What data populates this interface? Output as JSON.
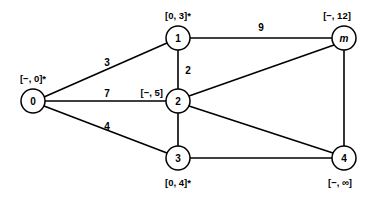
{
  "diagram": {
    "type": "weighted-undirected-graph",
    "title": "",
    "canvas": {
      "width": 369,
      "height": 199,
      "background": "#ffffff"
    },
    "stroke_color": "#000000",
    "node_fill": "#ffffff"
  },
  "nodes": [
    {
      "id": "0",
      "text": "0",
      "italic": false,
      "x": 33,
      "y": 101,
      "r": 12,
      "label": "[−, 0]*",
      "label_x": 33,
      "label_y": 78,
      "label_anchor": "middle"
    },
    {
      "id": "1",
      "text": "1",
      "italic": false,
      "x": 178,
      "y": 38,
      "r": 12,
      "label": "[0, 3]*",
      "label_x": 178,
      "label_y": 15,
      "label_anchor": "middle"
    },
    {
      "id": "2",
      "text": "2",
      "italic": false,
      "x": 178,
      "y": 101,
      "r": 12,
      "label": "[−, 5]",
      "label_x": 163,
      "label_y": 92,
      "label_anchor": "end"
    },
    {
      "id": "3",
      "text": "3",
      "italic": false,
      "x": 178,
      "y": 158,
      "r": 12,
      "label": "[0, 4]*",
      "label_x": 178,
      "label_y": 182,
      "label_anchor": "middle"
    },
    {
      "id": "m",
      "text": "m",
      "italic": true,
      "x": 344,
      "y": 38,
      "r": 12,
      "label": "[−, 12]",
      "label_x": 337,
      "label_y": 15,
      "label_anchor": "middle"
    },
    {
      "id": "4",
      "text": "4",
      "italic": false,
      "x": 344,
      "y": 158,
      "r": 12,
      "label": "[−, ∞]",
      "label_x": 340,
      "label_y": 182,
      "label_anchor": "middle"
    }
  ],
  "edges": [
    {
      "from": "0",
      "to": "1",
      "weight": "3",
      "weight_x": 107,
      "weight_y": 62,
      "x1": 44,
      "y1": 97,
      "x2": 167,
      "y2": 43
    },
    {
      "from": "0",
      "to": "2",
      "weight": "7",
      "weight_x": 107,
      "weight_y": 93,
      "x1": 45,
      "y1": 101,
      "x2": 166,
      "y2": 101
    },
    {
      "from": "0",
      "to": "3",
      "weight": "4",
      "weight_x": 107,
      "weight_y": 126,
      "x1": 44,
      "y1": 106,
      "x2": 167,
      "y2": 153
    },
    {
      "from": "1",
      "to": "2",
      "weight": "2",
      "weight_x": 188,
      "weight_y": 70,
      "x1": 178,
      "y1": 50,
      "x2": 178,
      "y2": 89
    },
    {
      "from": "1",
      "to": "m",
      "weight": "9",
      "weight_x": 261,
      "weight_y": 27,
      "x1": 190,
      "y1": 38,
      "x2": 332,
      "y2": 38
    },
    {
      "from": "2",
      "to": "m",
      "weight": "",
      "weight_x": 0,
      "weight_y": 0,
      "x1": 189,
      "y1": 96,
      "x2": 334,
      "y2": 45
    },
    {
      "from": "2",
      "to": "3",
      "weight": "",
      "weight_x": 0,
      "weight_y": 0,
      "x1": 178,
      "y1": 113,
      "x2": 178,
      "y2": 146
    },
    {
      "from": "2",
      "to": "4",
      "weight": "",
      "weight_x": 0,
      "weight_y": 0,
      "x1": 189,
      "y1": 106,
      "x2": 333,
      "y2": 153
    },
    {
      "from": "3",
      "to": "4",
      "weight": "",
      "weight_x": 0,
      "weight_y": 0,
      "x1": 190,
      "y1": 158,
      "x2": 332,
      "y2": 158
    },
    {
      "from": "m",
      "to": "4",
      "weight": "",
      "weight_x": 0,
      "weight_y": 0,
      "x1": 344,
      "y1": 50,
      "x2": 344,
      "y2": 146
    }
  ]
}
